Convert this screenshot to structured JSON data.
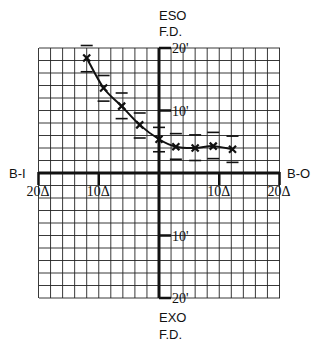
{
  "chart_data": {
    "type": "scatter",
    "title": "",
    "xlabel_left": "B-I",
    "xlabel_right": "B-O",
    "ylabel_top": [
      "ESO",
      "F.D."
    ],
    "ylabel_bottom": [
      "EXO",
      "F.D."
    ],
    "xlim": [
      -20,
      20
    ],
    "ylim": [
      -20,
      20
    ],
    "x_unit": "Δ",
    "y_unit": "'",
    "grid": true,
    "grid_step_x": 2,
    "grid_step_y": 2,
    "x_ticks": [
      {
        "value": -20,
        "label": "20Δ"
      },
      {
        "value": -10,
        "label": "10Δ"
      },
      {
        "value": 10,
        "label": "10Δ"
      },
      {
        "value": 20,
        "label": "20Δ"
      }
    ],
    "y_ticks": [
      {
        "value": 20,
        "label": "20'"
      },
      {
        "value": 10,
        "label": "10'"
      },
      {
        "value": -10,
        "label": "10'"
      },
      {
        "value": -20,
        "label": "20'"
      }
    ],
    "series": [
      {
        "name": "measurements",
        "marker": "x",
        "fit_curve": true,
        "points": [
          {
            "x": -12,
            "y": 18.4,
            "err_low": 2.2,
            "err_high": 2.0
          },
          {
            "x": -9.2,
            "y": 13.6,
            "err_low": 2.1,
            "err_high": 2.0
          },
          {
            "x": -6.2,
            "y": 10.7,
            "err_low": 2.0,
            "err_high": 2.1
          },
          {
            "x": -3.2,
            "y": 7.7,
            "err_low": 2.1,
            "err_high": 1.9
          },
          {
            "x": 0,
            "y": 5.4,
            "err_low": 2.0,
            "err_high": 1.9
          },
          {
            "x": 2.8,
            "y": 4.2,
            "err_low": 2.0,
            "err_high": 2.1
          },
          {
            "x": 6,
            "y": 4.0,
            "err_low": 2.0,
            "err_high": 2.1
          },
          {
            "x": 9,
            "y": 4.3,
            "err_low": 2.0,
            "err_high": 2.2
          },
          {
            "x": 12.2,
            "y": 3.8,
            "err_low": 2.1,
            "err_high": 2.1
          }
        ]
      }
    ],
    "colors": {
      "ink": "#111111",
      "grid": "#222222",
      "background": "#ffffff"
    }
  }
}
